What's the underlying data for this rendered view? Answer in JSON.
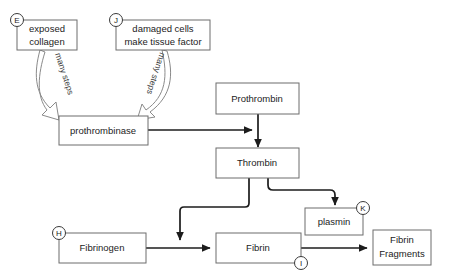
{
  "diagram": {
    "background_color": "#ffffff",
    "box_stroke_color": "#6d6d6d",
    "arrow_color": "#1c1c1c",
    "hollow_arrow_stroke": "#8a8a8a",
    "nodes": {
      "exposed_collagen": {
        "line1": "exposed",
        "line2": "collagen",
        "tag": "E"
      },
      "damaged_cells": {
        "line1": "damaged cells",
        "line2": "make tissue factor",
        "tag": "J"
      },
      "prothrombinase": {
        "label": "prothrombinase"
      },
      "prothrombin": {
        "label": "Prothrombin"
      },
      "thrombin": {
        "label": "Thrombin"
      },
      "plasmin": {
        "label": "plasmin",
        "tag": "K"
      },
      "fibrinogen": {
        "label": "Fibrinogen",
        "tag": "H"
      },
      "fibrin": {
        "label": "Fibrin",
        "tag": "I"
      },
      "fibrin_fragments": {
        "line1": "Fibrin",
        "line2": "Fragments"
      }
    },
    "edge_labels": {
      "many_steps_left": "many steps",
      "many_steps_right": "many steps"
    }
  }
}
